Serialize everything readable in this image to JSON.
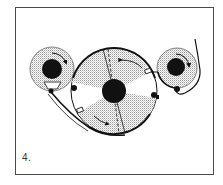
{
  "figure": {
    "step_label": "4.",
    "colors": {
      "ink": "#111111",
      "frame": "#4a4a4a",
      "stipple": "#bdbdbd",
      "paper": "#ffffff"
    },
    "components": [
      {
        "name": "left-reel",
        "description": "supply reel with clockwise arrow"
      },
      {
        "name": "center-drum",
        "description": "large drum with four stippled sectors, two dashed radial lines, two rotation arrows"
      },
      {
        "name": "right-reel",
        "description": "take-up reel with clockwise arrow and exiting tape"
      },
      {
        "name": "tape-path",
        "description": "tape running from left reel under the drum up to the right reel"
      }
    ]
  }
}
